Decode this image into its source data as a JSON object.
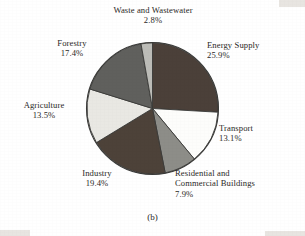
{
  "figure": {
    "caption": "(b)"
  },
  "chart_data": {
    "type": "pie",
    "title": "",
    "subtitle": "",
    "xlabel": "",
    "ylabel": "",
    "grid": false,
    "legend_position": "callout-labels-around-pie",
    "units": "percent",
    "total": 100.0,
    "start_angle_deg": 0,
    "direction": "clockwise",
    "categories": [
      "Energy Supply",
      "Transport",
      "Residential and Commercial Buildings",
      "Industry",
      "Agriculture",
      "Forestry",
      "Waste and Wastewater"
    ],
    "values": [
      25.9,
      13.1,
      7.9,
      19.4,
      13.5,
      17.4,
      2.8
    ],
    "value_labels": [
      "25.9%",
      "13.1%",
      "7.9%",
      "19.4%",
      "13.5%",
      "17.4%",
      "2.8%"
    ],
    "colors": [
      "#4b4039",
      "#fdfdfb",
      "#8d8d88",
      "#4d4239",
      "#e9e8e3",
      "#60605d",
      "#bcbcb7"
    ],
    "slices": [
      {
        "name": "Energy Supply",
        "value": 25.9,
        "label": "Energy Supply",
        "value_label": "25.9%",
        "color": "#4b4039",
        "start_deg": 0.0,
        "end_deg": 93.24
      },
      {
        "name": "Transport",
        "value": 13.1,
        "label": "Transport",
        "value_label": "13.1%",
        "color": "#fdfdfb",
        "start_deg": 93.24,
        "end_deg": 140.4
      },
      {
        "name": "Residential and Commercial Buildings",
        "value": 7.9,
        "label_line1": "Residential and",
        "label_line2": "Commercial Buildings",
        "value_label": "7.9%",
        "color": "#8d8d88",
        "start_deg": 140.4,
        "end_deg": 168.84
      },
      {
        "name": "Industry",
        "value": 19.4,
        "label": "Industry",
        "value_label": "19.4%",
        "color": "#4d4239",
        "start_deg": 168.84,
        "end_deg": 238.68
      },
      {
        "name": "Agriculture",
        "value": 13.5,
        "label": "Agriculture",
        "value_label": "13.5%",
        "color": "#e9e8e3",
        "start_deg": 238.68,
        "end_deg": 287.28
      },
      {
        "name": "Forestry",
        "value": 17.4,
        "label": "Forestry",
        "value_label": "17.4%",
        "color": "#60605d",
        "start_deg": 287.28,
        "end_deg": 349.92
      },
      {
        "name": "Waste and Wastewater",
        "value": 2.8,
        "label": "Waste and Wastewater",
        "value_label": "2.8%",
        "color": "#bcbcb7",
        "start_deg": 349.92,
        "end_deg": 360.0
      }
    ]
  },
  "labels": {
    "waste": {
      "name": "Waste and Wastewater",
      "pct": "2.8%"
    },
    "forestry": {
      "name": "Forestry",
      "pct": "17.4%"
    },
    "agriculture": {
      "name": "Agriculture",
      "pct": "13.5%"
    },
    "industry": {
      "name": "Industry",
      "pct": "19.4%"
    },
    "residential": {
      "line1": "Residential and",
      "line2": "Commercial Buildings",
      "pct": "7.9%"
    },
    "transport": {
      "name": "Transport",
      "pct": "13.1%"
    },
    "energy": {
      "name": "Energy Supply",
      "pct": "25.9%"
    }
  }
}
